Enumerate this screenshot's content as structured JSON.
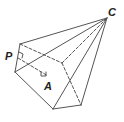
{
  "diagram": {
    "type": "geometric-solid",
    "colors": {
      "stroke": "#555555",
      "label": "#222222",
      "background": "#ffffff"
    },
    "labels": {
      "apex": "C",
      "point_p": "P",
      "point_a": "A"
    },
    "vertices": {
      "C": [
        107,
        18
      ],
      "top_left": [
        20,
        44
      ],
      "left": [
        15,
        72
      ],
      "bottom": [
        53,
        109
      ],
      "bottom_right": [
        81,
        105
      ],
      "hidden_back": [
        62,
        63
      ]
    }
  }
}
